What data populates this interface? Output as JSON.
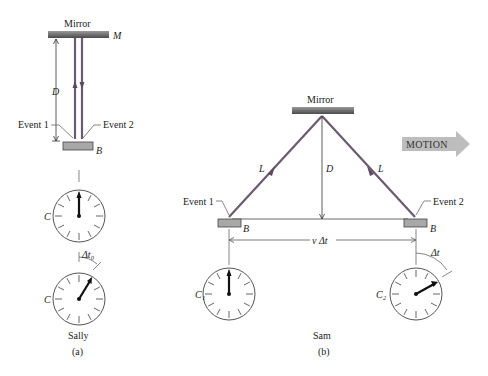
{
  "panel_a": {
    "mirror_label": "Mirror",
    "mirror_symbol": "M",
    "distance_label": "D",
    "event1_label": "Event 1",
    "event2_label": "Event 2",
    "box_label": "B",
    "clock_top_label": "C",
    "clock_bottom_label": "C",
    "interval_label": "Δt₀",
    "observer": "Sally",
    "caption": "(a)"
  },
  "panel_b": {
    "mirror_label": "Mirror",
    "path_left_label": "L",
    "path_right_label": "L",
    "distance_label": "D",
    "event1_label": "Event 1",
    "event2_label": "Event 2",
    "box_left_label": "B",
    "box_right_label": "B",
    "displacement_label": "v Δt",
    "clock_left_label": "C₁",
    "clock_right_label": "C₂",
    "interval_label": "Δt",
    "motion_label": "MOTION",
    "observer": "Sam",
    "caption": "(b)"
  },
  "colors": {
    "beam": "#6b5a70",
    "mirror_dark": "#555555",
    "mirror_light": "#aaaaaa",
    "box_fill": "#a8a8a8",
    "motion_arrow": "#bdbdbd",
    "line": "#333333"
  }
}
